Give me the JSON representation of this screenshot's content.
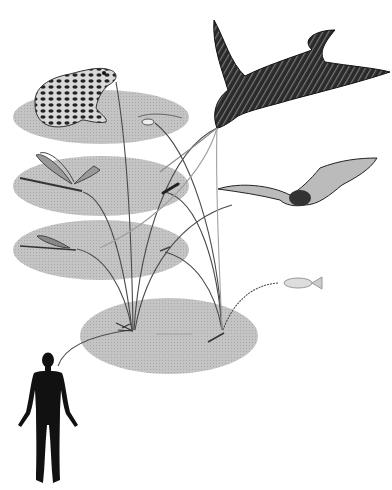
{
  "diagram": {
    "type": "food-web illustration",
    "background": "#ffffff",
    "ellipse_color": "#bdbdbd",
    "line_color": "#4a4a4a",
    "tiers": [
      {
        "id": "tier-1",
        "cx": 101,
        "cy": 117,
        "rx": 88,
        "ry": 27,
        "organisms": [
          "frog",
          "small-insect"
        ]
      },
      {
        "id": "tier-2",
        "cx": 101,
        "cy": 186,
        "rx": 88,
        "ry": 30,
        "organisms": [
          "dragonfly",
          "insect-larva"
        ]
      },
      {
        "id": "tier-3",
        "cx": 101,
        "cy": 250,
        "rx": 88,
        "ry": 30,
        "organisms": [
          "damselfly",
          "insect-nymph"
        ]
      },
      {
        "id": "tier-4",
        "cx": 169,
        "cy": 336,
        "rx": 89,
        "ry": 38,
        "organisms": [
          "mosquito-adult",
          "mosquito-larva"
        ]
      }
    ],
    "organisms": [
      {
        "name": "frog",
        "label": "Frog"
      },
      {
        "name": "swallow",
        "label": "Swallow"
      },
      {
        "name": "bat",
        "label": "Bat"
      },
      {
        "name": "fish",
        "label": "Fish"
      },
      {
        "name": "dragonfly",
        "label": "Dragonfly"
      },
      {
        "name": "damselfly",
        "label": "Damselfly"
      },
      {
        "name": "mosquito",
        "label": "Mosquito"
      },
      {
        "name": "human",
        "label": "Human"
      }
    ]
  }
}
